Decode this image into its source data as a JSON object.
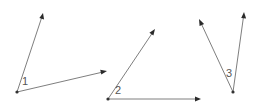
{
  "colors": {
    "ray": "#6f6f6f",
    "arrowhead": "#2a2a2a",
    "vertex": "#333333",
    "label": "#555555",
    "background": "#ffffff"
  },
  "angles": [
    {
      "label": "1",
      "vertex": [
        17,
        92
      ],
      "label_pos": [
        22,
        85
      ],
      "rays": [
        [
          43,
          13
        ],
        [
          107,
          71
        ]
      ]
    },
    {
      "label": "2",
      "vertex": [
        108,
        99
      ],
      "label_pos": [
        115,
        94
      ],
      "rays": [
        [
          155,
          29
        ],
        [
          201,
          99
        ]
      ]
    },
    {
      "label": "3",
      "vertex": [
        233,
        92
      ],
      "label_pos": [
        226,
        77
      ],
      "rays": [
        [
          199,
          19
        ],
        [
          244,
          12
        ]
      ]
    }
  ]
}
